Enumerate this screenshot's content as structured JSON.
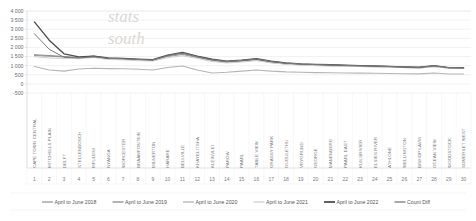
{
  "chart_data": {
    "type": "line",
    "title": "",
    "subtitle": "",
    "xlabel": "",
    "ylabel": "",
    "ylim": [
      -500,
      4000
    ],
    "ytick_values": [
      4000,
      3500,
      3000,
      2500,
      2000,
      1500,
      1000,
      500,
      0,
      -500
    ],
    "ytick_labels": [
      "4 000",
      "3 500",
      "3 000",
      "2 500",
      "2 000",
      "1 500",
      "1 000",
      "500",
      "0",
      "-500"
    ],
    "grid": true,
    "legend_position": "bottom",
    "index_labels": [
      "1",
      "2",
      "3",
      "4",
      "5",
      "6",
      "7",
      "8",
      "9",
      "10",
      "11",
      "12",
      "13",
      "14",
      "15",
      "16",
      "17",
      "18",
      "19",
      "20",
      "21",
      "22",
      "23",
      "24",
      "25",
      "26",
      "27",
      "28",
      "29",
      "30"
    ],
    "categories": [
      "CAPE TOWN CENTRAL",
      "MITCHELLS PLAIN",
      "DELFT",
      "STELLENBOSCH",
      "MFULENI",
      "NYANGA",
      "WORCESTER",
      "BRAAMFONTEIN",
      "MILNERTON",
      "HARARE",
      "BELLVILLE",
      "KHAYELITSHA",
      "KLEINVLEI",
      "PAROW",
      "PAARL",
      "TABLE VIEW",
      "GRASSY PARK",
      "GUGULETHU",
      "VRYGRUND",
      "GEORGE",
      "MANENBERG",
      "PAARL EAST",
      "KUILSRIVIER",
      "ELSIES RIVER",
      "ATHLONE",
      "WELLINGTON",
      "BISHOP LAVIS",
      "OCEAN VIEW",
      "WOODSTOCK",
      "SOMERSET WEST"
    ],
    "series": [
      {
        "name": "April to June 2018",
        "color": "#9a9a9a",
        "width": 1.1,
        "values": [
          1560,
          1520,
          1480,
          1420,
          1500,
          1380,
          1350,
          1300,
          1280,
          1500,
          1620,
          1450,
          1280,
          1180,
          1250,
          1320,
          1180,
          1100,
          1050,
          1020,
          1000,
          980,
          960,
          950,
          930,
          900,
          880,
          960,
          870,
          860
        ]
      },
      {
        "name": "April to June 2019",
        "color": "#8c8c8c",
        "width": 1.1,
        "values": [
          1600,
          1560,
          1500,
          1450,
          1530,
          1400,
          1380,
          1330,
          1310,
          1560,
          1700,
          1500,
          1330,
          1220,
          1280,
          1360,
          1220,
          1130,
          1080,
          1050,
          1030,
          1000,
          980,
          965,
          945,
          915,
          895,
          980,
          880,
          870
        ]
      },
      {
        "name": "April to June 2020",
        "color": "#b5b5b5",
        "width": 1.1,
        "values": [
          950,
          760,
          700,
          820,
          860,
          840,
          830,
          800,
          760,
          900,
          980,
          760,
          600,
          640,
          700,
          760,
          700,
          660,
          640,
          620,
          610,
          600,
          590,
          585,
          570,
          560,
          550,
          600,
          545,
          540
        ]
      },
      {
        "name": "April to June 2021",
        "color": "#cfcfcf",
        "width": 1.0,
        "values": [
          1500,
          1420,
          1400,
          1380,
          1450,
          1340,
          1320,
          1280,
          1250,
          1440,
          1540,
          1400,
          1230,
          1150,
          1200,
          1280,
          1150,
          1080,
          1030,
          1000,
          985,
          970,
          950,
          940,
          920,
          890,
          875,
          950,
          860,
          855
        ]
      },
      {
        "name": "April to June 2022",
        "color": "#4f4f4f",
        "width": 1.4,
        "values": [
          3400,
          2400,
          1650,
          1480,
          1520,
          1420,
          1400,
          1360,
          1330,
          1580,
          1720,
          1520,
          1350,
          1250,
          1300,
          1380,
          1240,
          1150,
          1100,
          1070,
          1050,
          1020,
          1000,
          980,
          960,
          930,
          910,
          1000,
          895,
          885
        ]
      },
      {
        "name": "Count Diff",
        "color": "#7b7b7b",
        "width": 1.0,
        "values": [
          2750,
          1900,
          1460,
          1420,
          1490,
          1400,
          1380,
          1340,
          1310,
          1550,
          1690,
          1490,
          1320,
          1230,
          1290,
          1360,
          1230,
          1140,
          1090,
          1060,
          1040,
          1010,
          990,
          975,
          955,
          925,
          905,
          990,
          890,
          880
        ]
      }
    ],
    "watermark": [
      "stats",
      "south"
    ]
  },
  "legend": {
    "items": [
      {
        "label": "April to June 2018",
        "color": "#9a9a9a"
      },
      {
        "label": "April to June 2019",
        "color": "#8c8c8c"
      },
      {
        "label": "April to June 2020",
        "color": "#b5b5b5"
      },
      {
        "label": "April to June 2021",
        "color": "#cfcfcf"
      },
      {
        "label": "April to June 2022",
        "color": "#4f4f4f"
      },
      {
        "label": "Count Diff",
        "color": "#7b7b7b"
      }
    ]
  }
}
